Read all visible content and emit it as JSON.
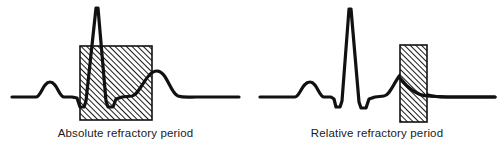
{
  "figure": {
    "background_color": "#ffffff",
    "stroke_color": "#111111",
    "hatch_color": "#1a1a1a",
    "width": 503,
    "height": 162
  },
  "panels": [
    {
      "id": "absolute",
      "caption": "Absolute refractory period",
      "shaded_region": {
        "name": "absolute-refractory-band",
        "x": 80,
        "y": 46,
        "width": 72,
        "height": 74,
        "fill": "diagonal-hatch",
        "border_color": "#111111"
      }
    },
    {
      "id": "relative",
      "caption": "Relative refractory period",
      "shaded_region": {
        "name": "relative-refractory-band",
        "x": 149,
        "y": 45,
        "width": 27,
        "height": 77,
        "fill": "diagonal-hatch",
        "border_color": "#111111"
      }
    }
  ],
  "chart_data": {
    "type": "line",
    "title": "",
    "subtitle": "",
    "xlabel": "",
    "ylabel": "",
    "grid": false,
    "legend": "none",
    "xlim": [
      0,
      251
    ],
    "ylim": [
      162,
      0
    ],
    "annotations": [
      "Absolute refractory period",
      "Relative refractory period"
    ],
    "series": [
      {
        "name": "ECG trace (absolute refractory period panel)",
        "waveform_landmarks": [
          {
            "label": "baseline-start",
            "x": 12,
            "y": 97
          },
          {
            "label": "P-wave-peak",
            "x": 50,
            "y": 82
          },
          {
            "label": "PR-segment",
            "x": 68,
            "y": 97
          },
          {
            "label": "Q-trough",
            "x": 80,
            "y": 107
          },
          {
            "label": "R-peak",
            "x": 97,
            "y": 8
          },
          {
            "label": "S-trough",
            "x": 110,
            "y": 107
          },
          {
            "label": "ST-segment",
            "x": 122,
            "y": 97
          },
          {
            "label": "T-wave-peak",
            "x": 155,
            "y": 71
          },
          {
            "label": "baseline-end",
            "x": 239,
            "y": 97
          }
        ],
        "path": "M 12 97 L 36 97 C 41 97 43 82 50 82 C 57 82 59 97 64 97 L 72 97 L 77 98 L 80 107 L 84 107 L 86 101 L 96 8 L 98 8 L 106 101 L 108 107 L 113 107 L 116 99 L 122 97 L 132 96 C 140 95 146 71 157 71 C 167 71 170 93 178 96 C 184 98 190 97 196 97 L 239 97"
      },
      {
        "name": "ECG trace (relative refractory period panel)",
        "waveform_landmarks": [
          {
            "label": "baseline-start",
            "x": 9,
            "y": 97
          },
          {
            "label": "P-wave-peak",
            "x": 59,
            "y": 82
          },
          {
            "label": "PR-segment",
            "x": 76,
            "y": 97
          },
          {
            "label": "Q-trough",
            "x": 85,
            "y": 107
          },
          {
            "label": "R-peak",
            "x": 99,
            "y": 9
          },
          {
            "label": "S-trough",
            "x": 112,
            "y": 108
          },
          {
            "label": "ST-segment",
            "x": 124,
            "y": 97
          },
          {
            "label": "T-wave-peak",
            "x": 152,
            "y": 71
          },
          {
            "label": "baseline-end",
            "x": 244,
            "y": 97
          }
        ],
        "path": "M 9 97 L 44 97 C 49 97 51 82 59 82 C 66 82 68 97 73 97 L 80 97 L 83 99 L 85 107 L 89 107 L 91 101 L 98 9 L 100 9 L 108 102 L 110 108 L 115 108 L 118 99 L 124 97 L 133 96 C 141 95 146 71 156 71 C 166 71 170 92 177 95 C 183 97 190 97 196 97 L 244 97"
      }
    ]
  }
}
